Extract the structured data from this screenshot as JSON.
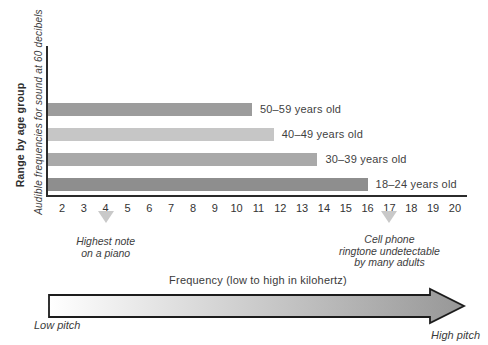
{
  "chart_data": {
    "type": "bar",
    "orientation": "horizontal",
    "y_axis_title": "Range by age group",
    "y_axis_subtitle": "Audible frequencies for sound at 60 decibels",
    "x_axis_title": "Frequency (low to high in kilohertz)",
    "x_unit": "kilohertz",
    "xlim": [
      2,
      20
    ],
    "x_ticks": [
      2,
      3,
      4,
      5,
      6,
      7,
      8,
      9,
      10,
      11,
      12,
      13,
      14,
      15,
      16,
      17,
      18,
      19,
      20
    ],
    "grid": false,
    "bars": [
      {
        "label": "50–59 years old",
        "max_khz": 10.7,
        "color": "#9c9c9c"
      },
      {
        "label": "40–49 years old",
        "max_khz": 11.7,
        "color": "#c6c6c6"
      },
      {
        "label": "30–39 years old",
        "max_khz": 13.7,
        "color": "#a9a9a9"
      },
      {
        "label": "18–24 years old",
        "max_khz": 16.0,
        "color": "#8e8e8e"
      }
    ],
    "markers": [
      {
        "value": 4,
        "label_lines": [
          "Highest note",
          "on a piano"
        ]
      },
      {
        "value": 17,
        "label_lines": [
          "Cell phone",
          "ringtone undetectable",
          "by many adults"
        ]
      }
    ],
    "marker_color": "#c9c9c9",
    "axis_color": "#2b2b2b"
  },
  "pitch_arrow": {
    "left_label": "Low pitch",
    "right_label": "High pitch",
    "gradient_start": "#ffffff",
    "gradient_end": "#979797",
    "outline_color": "#1c1c1c"
  }
}
